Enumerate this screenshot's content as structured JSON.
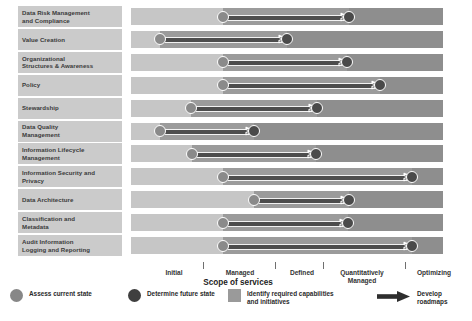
{
  "chart_data": {
    "type": "bar",
    "xlabel": "Scope of services",
    "ylabel": "",
    "grid": false,
    "legend_position": "bottom",
    "x_tick_labels": [
      "Initial",
      "Managed",
      "Defined",
      "Quantitatively Managed",
      "Optimizing"
    ],
    "xlim": [
      0,
      5
    ],
    "categories": [
      "Data Risk Management and Compliance",
      "Value Creation",
      "Organizational Structures & Awareness",
      "Policy",
      "Stewardship",
      "Data Quality Management",
      "Information Lifecycle Management",
      "Information Security and Privacy",
      "Data Architecture",
      "Classification and Metadata",
      "Audit Information Logging and Reporting"
    ],
    "series": [
      {
        "name": "Assess current state",
        "values": [
          1.48,
          0.47,
          1.48,
          1.48,
          0.96,
          0.47,
          1.0,
          1.48,
          1.98,
          1.48,
          1.48
        ]
      },
      {
        "name": "Determine future state",
        "values": [
          3.5,
          2.5,
          3.46,
          4.0,
          3.0,
          2.0,
          2.97,
          4.51,
          3.5,
          3.48,
          4.51
        ]
      }
    ],
    "annotations": [
      "Arrows represent roadmaps from current state to future state",
      "Shaded bar segments represent required capabilities and initiatives"
    ]
  },
  "rows": [
    {
      "label_line1": "Data Risk Management",
      "label_line2": "and Compliance",
      "start_x": 223,
      "end_x": 349
    },
    {
      "label_line1": "Value Creation",
      "label_line2": "",
      "start_x": 160,
      "end_x": 287
    },
    {
      "label_line1": "Organizational",
      "label_line2": "Structures & Awareness",
      "start_x": 223,
      "end_x": 347
    },
    {
      "label_line1": "Policy",
      "label_line2": "",
      "start_x": 223,
      "end_x": 380
    },
    {
      "label_line1": "Stewardship",
      "label_line2": "",
      "start_x": 191,
      "end_x": 317
    },
    {
      "label_line1": "Data Quality",
      "label_line2": "Management",
      "start_x": 160,
      "end_x": 254
    },
    {
      "label_line1": "Information Lifecycle",
      "label_line2": "Management",
      "start_x": 192,
      "end_x": 316
    },
    {
      "label_line1": "Information Security and",
      "label_line2": "Privacy",
      "start_x": 223,
      "end_x": 412
    },
    {
      "label_line1": "Data Architecture",
      "label_line2": "",
      "start_x": 254,
      "end_x": 349
    },
    {
      "label_line1": "Classification and",
      "label_line2": "Metadata",
      "start_x": 223,
      "end_x": 348
    },
    {
      "label_line1": "Audit Information",
      "label_line2": "Logging and Reporting",
      "start_x": 223,
      "end_x": 412
    }
  ],
  "axis": {
    "title": "Scope of services",
    "ticks": [
      {
        "label": "Initial",
        "label_line2": "",
        "center_x": 174,
        "sep_x": 203
      },
      {
        "label": "Managed",
        "label_line2": "",
        "center_x": 240,
        "sep_x": 275
      },
      {
        "label": "Defined",
        "label_line2": "",
        "center_x": 302,
        "sep_x": 323
      },
      {
        "label": "Quantitatively",
        "label_line2": "Managed",
        "center_x": 362,
        "sep_x": 405
      },
      {
        "label": "Optimizing",
        "label_line2": "",
        "center_x": 434,
        "sep_x": null
      }
    ]
  },
  "legend": {
    "items": [
      {
        "icon": "circle-light-icon",
        "text_line1": "Assess current state",
        "text_line2": "",
        "x": 10,
        "width": 100
      },
      {
        "icon": "circle-dark-icon",
        "text_line1": "Determine future state",
        "text_line2": "",
        "x": 128,
        "width": 110
      },
      {
        "icon": "square-gray-icon",
        "text_line1": "Identify required capabilities",
        "text_line2": "and initiatives",
        "x": 228,
        "width": 140
      },
      {
        "icon": "arrow-right-icon",
        "text_line1": "Develop roadmaps",
        "text_line2": "",
        "x": 377,
        "width": 95
      }
    ]
  },
  "colors": {
    "background": "#ffffff",
    "label_box": "#cbcbcb",
    "bar_base": "#c6c6c6",
    "bar_mid": "#9b9b9b",
    "bar_tail": "#8e8e8e",
    "dot_start": "#8a8a8a",
    "dot_end": "#4a4a4a",
    "shaft": "#4d4d4d",
    "text": "#333333"
  }
}
